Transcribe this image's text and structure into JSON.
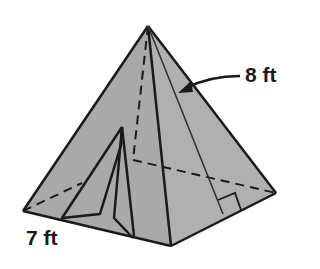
{
  "figure": {
    "type": "square pyramid",
    "labels": {
      "slant_height": "8 ft",
      "base_edge": "7 ft"
    },
    "colors": {
      "face": "#a9a9a9",
      "edge": "#1a1a1a",
      "background": "#ffffff"
    }
  }
}
